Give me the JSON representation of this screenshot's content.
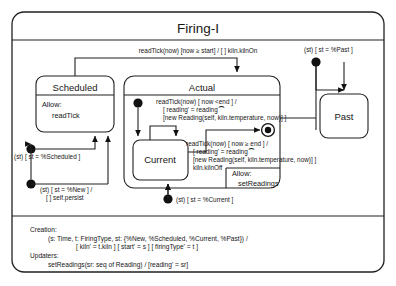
{
  "diagram": {
    "type": "uml-statechart",
    "title": "Firing-I",
    "states": {
      "scheduled": {
        "name": "Scheduled",
        "compartment_header": "Allow:",
        "compartment_body": "readTick"
      },
      "actual": {
        "name": "Actual",
        "compartment_header": "Allow:",
        "compartment_body": "setReadings"
      },
      "current": {
        "name": "Current"
      },
      "past": {
        "name": "Past"
      }
    },
    "transitions": {
      "scheduled_to_actual": "readTick(now) [now ≥ start] / [ ] kiln.kilnOn",
      "entry_past": "(st) [ st = %Past ]",
      "entry_scheduled": "(st) [ st = %Scheduled ]",
      "entry_new_l1": "(st) [ st = %New ] /",
      "entry_new_l2": "[ ] self.persist",
      "entry_current": "(st) [ st = %Current ]",
      "current_self_l1": "readTick(now) [ now <end ] /",
      "current_self_l2": "[ reading' = reading ⁀",
      "current_self_l3": "[new Reading(self, kiln.temperature, now)] ]",
      "current_final_l1": "readTick(now) [ now ≥ end ] /",
      "current_final_l2": "[ reading' = reading ⁀",
      "current_final_l3": "[new Reading(self, kiln.temperature, now)] ]",
      "current_final_l4": "kiln.kilnOff"
    },
    "footer": {
      "creation_header": "Creation:",
      "creation_line1": "(s: Time, t: FiringType, st: {%New, %Scheduled, %Current, %Past}) /",
      "creation_line2": "[ kiln' = t.kiln ] [ start' = s ] [ firingType' = t ]",
      "updaters_header": "Updaters:",
      "updaters_line1": "setReadings(sr: seq of Reading) / [reading' = sr]"
    }
  },
  "colors": {
    "stroke": "#202020",
    "background": "#ffffff",
    "text": "#161616"
  }
}
